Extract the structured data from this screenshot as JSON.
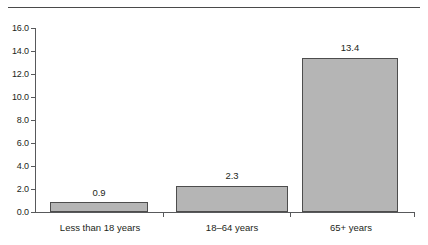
{
  "chart_data": {
    "type": "bar",
    "title": "",
    "subtitle": "",
    "xlabel": "",
    "ylabel": "",
    "categories": [
      "Less than 18 years",
      "18–64 years",
      "65+ years"
    ],
    "values": [
      0.9,
      2.3,
      13.4
    ],
    "value_labels": [
      "0.9",
      "2.3",
      "13.4"
    ],
    "ylim": [
      0,
      16
    ],
    "ytick_step": 2,
    "ytick_labels": [
      "16.0",
      "14.0",
      "12.0",
      "10.0",
      "8.0",
      "6.0",
      "4.0",
      "2.0",
      "0.0"
    ],
    "ytick_values": [
      16,
      14,
      12,
      10,
      8,
      6,
      4,
      2,
      0
    ],
    "grid": false,
    "legend": null,
    "legend_position": "none",
    "bar_fill_color": "#b5b5b5",
    "bar_border_color": "#4d4d4d",
    "axis_color": "#58595b",
    "text_color": "#231f20",
    "rule_color": "#4a4a4a",
    "background_color": "#ffffff",
    "annotations": []
  }
}
